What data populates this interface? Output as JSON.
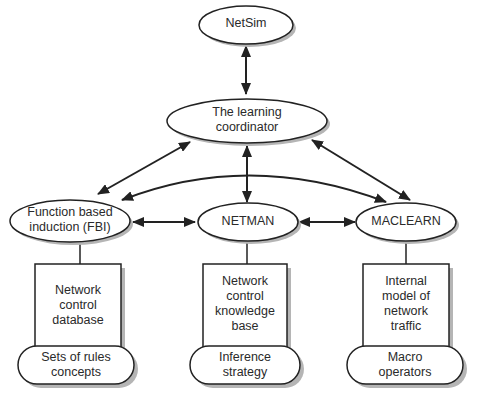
{
  "diagram": {
    "nodes": {
      "netsim": {
        "label": "NetSim"
      },
      "coordinator": {
        "label": "The learning\ncoordinator"
      },
      "fbi": {
        "label": "Function based\ninduction (FBI)"
      },
      "netman": {
        "label": "NETMAN"
      },
      "maclearn": {
        "label": "MACLEARN"
      }
    },
    "boxes": {
      "fbi": {
        "label": "Network\ncontrol\ndatabase",
        "base": "Sets of rules\nconcepts"
      },
      "netman": {
        "label": "Network\ncontrol\nknowledge\nbase",
        "base": "Inference\nstrategy"
      },
      "maclearn": {
        "label": "Internal\nmodel of\nnetwork\ntraffic",
        "base": "Macro\noperators"
      }
    },
    "edges": [
      {
        "from": "NetSim",
        "to": "The learning coordinator",
        "type": "bidirectional"
      },
      {
        "from": "The learning coordinator",
        "to": "Function based induction (FBI)",
        "type": "bidirectional"
      },
      {
        "from": "The learning coordinator",
        "to": "NETMAN",
        "type": "bidirectional"
      },
      {
        "from": "The learning coordinator",
        "to": "MACLEARN",
        "type": "bidirectional"
      },
      {
        "from": "Function based induction (FBI)",
        "to": "MACLEARN",
        "type": "bidirectional-curved"
      },
      {
        "from": "Function based induction (FBI)",
        "to": "NETMAN",
        "type": "bidirectional"
      },
      {
        "from": "NETMAN",
        "to": "MACLEARN",
        "type": "bidirectional"
      }
    ],
    "colors": {
      "stroke": "#222222",
      "shadow": "#b5b5b5",
      "fill": "#ffffff",
      "text": "#2a2a2a"
    }
  }
}
